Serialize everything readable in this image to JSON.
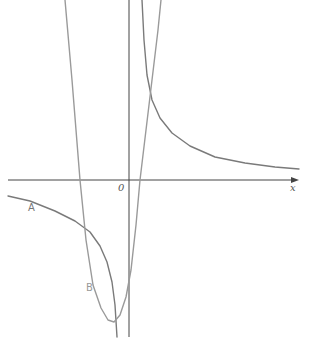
{
  "chart_data": {
    "type": "line",
    "title": "",
    "xlabel": "x",
    "ylabel": "y",
    "origin_label": "0",
    "grid": false,
    "legend": "inline curve labels",
    "colors": {
      "axis": "#444444",
      "curve_A": "#7a7a7a",
      "curve_B": "#9a9a9a",
      "label": "#777777"
    },
    "series": [
      {
        "name": "A",
        "kind": "hyperbola (two branches, vertical asymptote just left of y-axis)",
        "branches": [
          {
            "points_px": [
              [
                8,
                196
              ],
              [
                30,
                201
              ],
              [
                55,
                211
              ],
              [
                75,
                221
              ],
              [
                90,
                232
              ],
              [
                100,
                246
              ],
              [
                107,
                262
              ],
              [
                112,
                282
              ],
              [
                115,
                305
              ],
              [
                117,
                337
              ]
            ]
          },
          {
            "points_px": [
              [
                142,
                0
              ],
              [
                144,
                40
              ],
              [
                147,
                75
              ],
              [
                152,
                100
              ],
              [
                160,
                118
              ],
              [
                172,
                133
              ],
              [
                190,
                146
              ],
              [
                215,
                157
              ],
              [
                245,
                163
              ],
              [
                275,
                167
              ],
              [
                299,
                169
              ]
            ]
          }
        ]
      },
      {
        "name": "B",
        "kind": "parabola (opens upward, vertex below x-axis left of origin)",
        "points_px": [
          [
            65,
            0
          ],
          [
            72,
            80
          ],
          [
            80,
            180
          ],
          [
            86,
            240
          ],
          [
            93,
            285
          ],
          [
            101,
            308
          ],
          [
            108,
            320
          ],
          [
            114,
            322
          ],
          [
            120,
            315
          ],
          [
            126,
            297
          ],
          [
            131,
            270
          ],
          [
            136,
            225
          ],
          [
            140,
            180
          ],
          [
            146,
            130
          ],
          [
            152,
            80
          ],
          [
            158,
            30
          ],
          [
            161,
            0
          ]
        ]
      }
    ]
  },
  "labels": {
    "origin": "0",
    "x_axis": "x",
    "curve_A": "A",
    "curve_B": "B"
  }
}
